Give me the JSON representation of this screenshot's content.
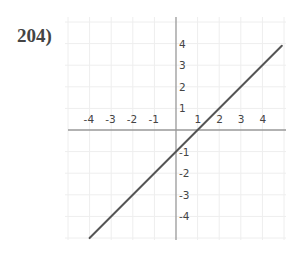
{
  "problem": {
    "number": "204)"
  },
  "chart_data": {
    "type": "line",
    "title": "",
    "xlabel": "",
    "ylabel": "",
    "xlim": [
      -5,
      5
    ],
    "ylim": [
      -5,
      5
    ],
    "grid": true,
    "x_ticks": [
      -4,
      -3,
      -2,
      -1,
      1,
      2,
      3,
      4
    ],
    "y_ticks": [
      4,
      3,
      2,
      1,
      -1,
      -2,
      -3,
      -4
    ],
    "series": [
      {
        "name": "y = x - 1",
        "equation": "y = x - 1",
        "slope": 1,
        "intercept": -1,
        "x": [
          -4,
          4.9
        ],
        "y": [
          -5,
          3.9
        ]
      }
    ],
    "colors": {
      "line": "#555555",
      "axis": "#999999",
      "grid": "#eeeeee",
      "text": "#444444"
    }
  }
}
